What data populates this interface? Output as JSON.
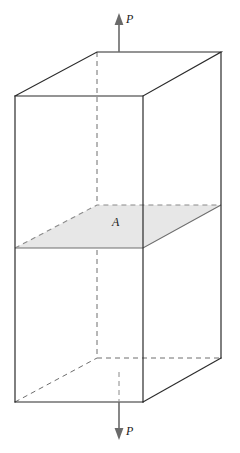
{
  "figure": {
    "background_color": "#ffffff",
    "labels": {
      "force_top": "P",
      "force_bottom": "P",
      "cross_section": "A"
    },
    "colors": {
      "edge_solid": "#2b2b2b",
      "edge_hidden": "#6e6e6e",
      "cross_section_fill": "#e7e7e7",
      "cross_section_stroke": "#6e6e6e",
      "arrow": "#555555",
      "text": "#1a1a1a"
    },
    "geometry": {
      "front_top_left": [
        15,
        96
      ],
      "front_top_right": [
        143,
        96
      ],
      "back_top_left": [
        97,
        52
      ],
      "back_top_right": [
        221,
        52
      ],
      "front_bottom_left": [
        15,
        402
      ],
      "front_bottom_right": [
        143,
        402
      ],
      "back_bottom_left": [
        97,
        358
      ],
      "back_bottom_right": [
        221,
        358
      ],
      "section_front_left": [
        15,
        248
      ],
      "section_front_right": [
        143,
        248
      ],
      "section_back_left": [
        97,
        205
      ],
      "section_back_right": [
        221,
        205
      ],
      "center_axis_x": 97,
      "arrow_x": 119,
      "arrow_top_tip_y": 14,
      "arrow_top_tail_y": 52,
      "arrow_bottom_tip_y": 440,
      "arrow_bottom_tail_y": 402
    },
    "icon_names": {
      "top": "arrow-up-icon",
      "bottom": "arrow-down-icon"
    }
  }
}
